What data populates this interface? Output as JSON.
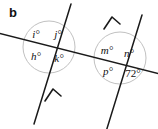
{
  "figure": {
    "part_label": "b",
    "background_color": "#ffffff",
    "line_color": "#1a1a1a",
    "circle_color": "#b9b9b9",
    "width": 158,
    "height": 129,
    "transversal": {
      "name": "crossing-line",
      "x1": -2,
      "y1": 33,
      "x2": 160,
      "y2": 74
    },
    "parallel_lines": [
      {
        "name": "parallel-line-left",
        "x1": 71,
        "y1": 4,
        "x2": 34,
        "y2": 124,
        "arrow_at": {
          "x": 52.5,
          "y": 92
        }
      },
      {
        "name": "parallel-line-right",
        "x1": 142,
        "y1": 15,
        "x2": 105,
        "y2": 135,
        "arrow_at": {
          "x": 110,
          "y": 19
        }
      }
    ],
    "intersections": [
      {
        "name": "intersection-left",
        "cx": 49,
        "cy": 47,
        "r": 26,
        "angles": [
          {
            "key": "i",
            "text": "i°",
            "x": 36,
            "y": 34,
            "numeric": false
          },
          {
            "key": "j",
            "text": "j°",
            "x": 58,
            "y": 34,
            "numeric": false
          },
          {
            "key": "h",
            "text": "h°",
            "x": 36,
            "y": 56,
            "numeric": false
          },
          {
            "key": "k",
            "text": "k°",
            "x": 59,
            "y": 58,
            "numeric": false
          }
        ]
      },
      {
        "name": "intersection-right",
        "cx": 120,
        "cy": 58,
        "r": 26,
        "angles": [
          {
            "key": "m",
            "text": "m°",
            "x": 107,
            "y": 50,
            "numeric": false
          },
          {
            "key": "n",
            "text": "n°",
            "x": 129,
            "y": 53,
            "numeric": false
          },
          {
            "key": "p",
            "text": "p°",
            "x": 108,
            "y": 71,
            "numeric": false
          },
          {
            "key": "angle72",
            "text": "72°",
            "x": 133,
            "y": 73,
            "numeric": true
          }
        ]
      }
    ]
  }
}
